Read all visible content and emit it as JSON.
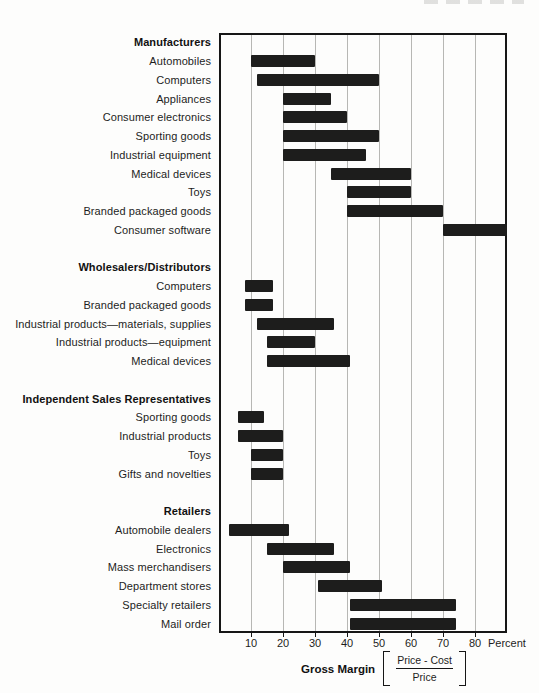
{
  "chart_data": {
    "type": "bar",
    "variant": "horizontal-range-bars",
    "title": "",
    "xlabel": "Gross Margin",
    "xlim": [
      0,
      90
    ],
    "x_ticks": [
      10,
      20,
      30,
      40,
      50,
      60,
      70,
      80
    ],
    "x_suffix_label": "Percent",
    "grid": true,
    "legend_position": "none",
    "bar_color": "#1d1d1c",
    "gridline_color": "#b7b7b4",
    "border_color": "#161616",
    "sections": [
      {
        "header": "Manufacturers",
        "rows": [
          {
            "label": "Automobiles",
            "range": [
              10,
              30
            ]
          },
          {
            "label": "Computers",
            "range": [
              12,
              50
            ]
          },
          {
            "label": "Appliances",
            "range": [
              20,
              35
            ]
          },
          {
            "label": "Consumer electronics",
            "range": [
              20,
              40
            ]
          },
          {
            "label": "Sporting goods",
            "range": [
              20,
              50
            ]
          },
          {
            "label": "Industrial equipment",
            "range": [
              20,
              46
            ]
          },
          {
            "label": "Medical devices",
            "range": [
              35,
              60
            ]
          },
          {
            "label": "Toys",
            "range": [
              40,
              60
            ]
          },
          {
            "label": "Branded packaged goods",
            "range": [
              40,
              70
            ]
          },
          {
            "label": "Consumer software",
            "range": [
              70,
              90
            ]
          }
        ]
      },
      {
        "header": "Wholesalers/Distributors",
        "rows": [
          {
            "label": "Computers",
            "range": [
              8,
              17
            ]
          },
          {
            "label": "Branded packaged goods",
            "range": [
              8,
              17
            ]
          },
          {
            "label": "Industrial products—materials, supplies",
            "range": [
              12,
              36
            ]
          },
          {
            "label": "Industrial products—equipment",
            "range": [
              15,
              30
            ]
          },
          {
            "label": "Medical devices",
            "range": [
              15,
              41
            ]
          }
        ]
      },
      {
        "header": "Independent Sales Representatives",
        "rows": [
          {
            "label": "Sporting goods",
            "range": [
              6,
              14
            ]
          },
          {
            "label": "Industrial products",
            "range": [
              6,
              20
            ]
          },
          {
            "label": "Toys",
            "range": [
              10,
              20
            ]
          },
          {
            "label": "Gifts and novelties",
            "range": [
              10,
              20
            ]
          }
        ]
      },
      {
        "header": "Retailers",
        "rows": [
          {
            "label": "Automobile dealers",
            "range": [
              3,
              22
            ]
          },
          {
            "label": "Electronics",
            "range": [
              15,
              36
            ]
          },
          {
            "label": "Mass merchandisers",
            "range": [
              20,
              41
            ]
          },
          {
            "label": "Department stores",
            "range": [
              31,
              51
            ]
          },
          {
            "label": "Specialty retailers",
            "range": [
              41,
              74
            ]
          },
          {
            "label": "Mail order",
            "range": [
              41,
              74
            ]
          }
        ]
      }
    ],
    "footer": {
      "label": "Gross Margin",
      "formula_numerator": "Price - Cost",
      "formula_denominator": "Price"
    }
  }
}
